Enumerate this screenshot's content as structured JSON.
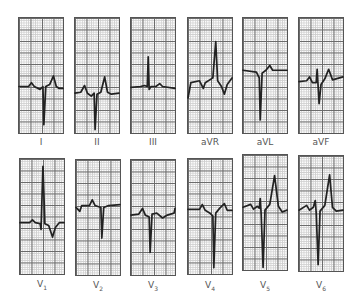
{
  "figure": {
    "limb_leads": [
      {
        "id": "I",
        "label": "I"
      },
      {
        "id": "II",
        "label": "II"
      },
      {
        "id": "III",
        "label": "III"
      },
      {
        "id": "aVR",
        "label": "aVR"
      },
      {
        "id": "aVL",
        "label": "aVL"
      },
      {
        "id": "aVF",
        "label": "aVF"
      }
    ],
    "precordial_leads": [
      {
        "id": "V1",
        "label": "V",
        "sub": "1"
      },
      {
        "id": "V2",
        "label": "V",
        "sub": "2"
      },
      {
        "id": "V3",
        "label": "V",
        "sub": "3"
      },
      {
        "id": "V4",
        "label": "V",
        "sub": "4"
      },
      {
        "id": "V5",
        "label": "V",
        "sub": "5"
      },
      {
        "id": "V6",
        "label": "V",
        "sub": "6"
      }
    ],
    "colors": {
      "trace": "#222222",
      "grid_major": "#6a6a6a",
      "grid_minor": "#cfcfcf",
      "background": "#ffffff"
    }
  }
}
